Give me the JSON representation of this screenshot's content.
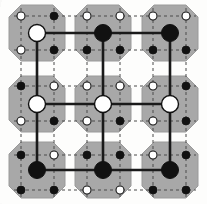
{
  "figure": {
    "type": "diagram",
    "width": 207,
    "height": 204,
    "background_color": "#fdfdfc",
    "tile_color": "#a8a8a8",
    "tile_edge_color": "#9a9a9a",
    "dashed_line_color": "#4a4a4a",
    "solid_line_color": "#1a1a1a",
    "node_black_color": "#111111",
    "node_white_color": "#ffffff",
    "node_outline_color": "#111111"
  },
  "geometry": {
    "tile_size": 56,
    "tile_corner_cut": 12,
    "tile_centers_x": [
      37,
      103,
      170
    ],
    "tile_centers_y": [
      33,
      104,
      170
    ],
    "dash_cols_x": [
      21,
      54,
      87,
      120,
      153,
      186
    ],
    "dash_rows_y": [
      16,
      50,
      86,
      121,
      155,
      190
    ],
    "big_node_radius": 8.5,
    "small_node_radius": 4.0,
    "solid_line_width": 2.6,
    "dashed_line_width": 1.0,
    "dash_pattern": "3,3"
  },
  "tiles": [
    {
      "id": "tile-r0-c0",
      "row": 0,
      "col": 0,
      "center": {
        "x": 37,
        "y": 33
      },
      "center_node": "white",
      "corner_nodes": [
        {
          "position": "top-left",
          "x": 21,
          "y": 16,
          "fill": "white"
        },
        {
          "position": "top-right",
          "x": 54,
          "y": 16,
          "fill": "black"
        },
        {
          "position": "bottom-left",
          "x": 21,
          "y": 50,
          "fill": "white"
        },
        {
          "position": "bottom-right",
          "x": 54,
          "y": 50,
          "fill": "black"
        }
      ]
    },
    {
      "id": "tile-r0-c1",
      "row": 0,
      "col": 1,
      "center": {
        "x": 103,
        "y": 33
      },
      "center_node": "black",
      "corner_nodes": [
        {
          "position": "top-left",
          "x": 87,
          "y": 16,
          "fill": "white"
        },
        {
          "position": "top-right",
          "x": 120,
          "y": 16,
          "fill": "white"
        },
        {
          "position": "bottom-left",
          "x": 87,
          "y": 50,
          "fill": "black"
        },
        {
          "position": "bottom-right",
          "x": 120,
          "y": 50,
          "fill": "black"
        }
      ]
    },
    {
      "id": "tile-r0-c2",
      "row": 0,
      "col": 2,
      "center": {
        "x": 170,
        "y": 33
      },
      "center_node": "black",
      "corner_nodes": [
        {
          "position": "top-left",
          "x": 153,
          "y": 16,
          "fill": "white"
        },
        {
          "position": "top-right",
          "x": 186,
          "y": 16,
          "fill": "white"
        },
        {
          "position": "bottom-left",
          "x": 153,
          "y": 50,
          "fill": "black"
        },
        {
          "position": "bottom-right",
          "x": 186,
          "y": 50,
          "fill": "black"
        }
      ]
    },
    {
      "id": "tile-r1-c0",
      "row": 1,
      "col": 0,
      "center": {
        "x": 37,
        "y": 104
      },
      "center_node": "white",
      "corner_nodes": [
        {
          "position": "top-left",
          "x": 21,
          "y": 86,
          "fill": "black"
        },
        {
          "position": "top-right",
          "x": 54,
          "y": 86,
          "fill": "white"
        },
        {
          "position": "bottom-left",
          "x": 21,
          "y": 121,
          "fill": "white"
        },
        {
          "position": "bottom-right",
          "x": 54,
          "y": 121,
          "fill": "black"
        }
      ]
    },
    {
      "id": "tile-r1-c1",
      "row": 1,
      "col": 1,
      "center": {
        "x": 103,
        "y": 104
      },
      "center_node": "white",
      "corner_nodes": [
        {
          "position": "top-left",
          "x": 87,
          "y": 86,
          "fill": "white"
        },
        {
          "position": "top-right",
          "x": 120,
          "y": 86,
          "fill": "white"
        },
        {
          "position": "bottom-left",
          "x": 87,
          "y": 121,
          "fill": "white"
        },
        {
          "position": "bottom-right",
          "x": 120,
          "y": 121,
          "fill": "black"
        }
      ]
    },
    {
      "id": "tile-r1-c2",
      "row": 1,
      "col": 2,
      "center": {
        "x": 170,
        "y": 104
      },
      "center_node": "white",
      "corner_nodes": [
        {
          "position": "top-left",
          "x": 153,
          "y": 86,
          "fill": "white"
        },
        {
          "position": "top-right",
          "x": 186,
          "y": 86,
          "fill": "black"
        },
        {
          "position": "bottom-left",
          "x": 153,
          "y": 121,
          "fill": "white"
        },
        {
          "position": "bottom-right",
          "x": 186,
          "y": 121,
          "fill": "black"
        }
      ]
    },
    {
      "id": "tile-r2-c0",
      "row": 2,
      "col": 0,
      "center": {
        "x": 37,
        "y": 170
      },
      "center_node": "black",
      "corner_nodes": [
        {
          "position": "top-left",
          "x": 21,
          "y": 155,
          "fill": "black"
        },
        {
          "position": "top-right",
          "x": 54,
          "y": 155,
          "fill": "white"
        },
        {
          "position": "bottom-left",
          "x": 21,
          "y": 190,
          "fill": "black"
        },
        {
          "position": "bottom-right",
          "x": 54,
          "y": 190,
          "fill": "black"
        }
      ]
    },
    {
      "id": "tile-r2-c1",
      "row": 2,
      "col": 1,
      "center": {
        "x": 103,
        "y": 170
      },
      "center_node": "black",
      "corner_nodes": [
        {
          "position": "top-left",
          "x": 87,
          "y": 155,
          "fill": "black"
        },
        {
          "position": "top-right",
          "x": 120,
          "y": 155,
          "fill": "black"
        },
        {
          "position": "bottom-left",
          "x": 87,
          "y": 190,
          "fill": "white"
        },
        {
          "position": "bottom-right",
          "x": 120,
          "y": 190,
          "fill": "white"
        }
      ]
    },
    {
      "id": "tile-r2-c2",
      "row": 2,
      "col": 2,
      "center": {
        "x": 170,
        "y": 170
      },
      "center_node": "black",
      "corner_nodes": [
        {
          "position": "top-left",
          "x": 153,
          "y": 155,
          "fill": "white"
        },
        {
          "position": "top-right",
          "x": 186,
          "y": 155,
          "fill": "black"
        },
        {
          "position": "bottom-left",
          "x": 153,
          "y": 190,
          "fill": "black"
        },
        {
          "position": "bottom-right",
          "x": 186,
          "y": 190,
          "fill": "black"
        }
      ]
    }
  ],
  "solid_edges": [
    {
      "from": {
        "x": 37,
        "y": 33
      },
      "to": {
        "x": 103,
        "y": 33
      }
    },
    {
      "from": {
        "x": 103,
        "y": 33
      },
      "to": {
        "x": 170,
        "y": 33
      }
    },
    {
      "from": {
        "x": 37,
        "y": 104
      },
      "to": {
        "x": 103,
        "y": 104
      }
    },
    {
      "from": {
        "x": 103,
        "y": 104
      },
      "to": {
        "x": 170,
        "y": 104
      }
    },
    {
      "from": {
        "x": 37,
        "y": 170
      },
      "to": {
        "x": 103,
        "y": 170
      }
    },
    {
      "from": {
        "x": 103,
        "y": 170
      },
      "to": {
        "x": 170,
        "y": 170
      }
    },
    {
      "from": {
        "x": 37,
        "y": 33
      },
      "to": {
        "x": 37,
        "y": 104
      }
    },
    {
      "from": {
        "x": 37,
        "y": 104
      },
      "to": {
        "x": 37,
        "y": 170
      }
    },
    {
      "from": {
        "x": 103,
        "y": 33
      },
      "to": {
        "x": 103,
        "y": 104
      }
    },
    {
      "from": {
        "x": 103,
        "y": 104
      },
      "to": {
        "x": 103,
        "y": 170
      }
    },
    {
      "from": {
        "x": 170,
        "y": 33
      },
      "to": {
        "x": 170,
        "y": 104
      }
    },
    {
      "from": {
        "x": 170,
        "y": 104
      },
      "to": {
        "x": 170,
        "y": 170
      }
    }
  ],
  "dashed_vertical_lines": [
    {
      "x": 21,
      "y1": 8,
      "y2": 198
    },
    {
      "x": 54,
      "y1": 8,
      "y2": 198
    },
    {
      "x": 87,
      "y1": 8,
      "y2": 198
    },
    {
      "x": 120,
      "y1": 8,
      "y2": 198
    },
    {
      "x": 153,
      "y1": 8,
      "y2": 198
    },
    {
      "x": 186,
      "y1": 8,
      "y2": 198
    }
  ],
  "dashed_horizontal_lines": [
    {
      "y": 16,
      "x1": 14,
      "x2": 196
    },
    {
      "y": 50,
      "x1": 14,
      "x2": 196
    },
    {
      "y": 86,
      "x1": 14,
      "x2": 196
    },
    {
      "y": 121,
      "x1": 14,
      "x2": 196
    },
    {
      "y": 155,
      "x1": 14,
      "x2": 196
    },
    {
      "y": 190,
      "x1": 14,
      "x2": 196
    }
  ]
}
